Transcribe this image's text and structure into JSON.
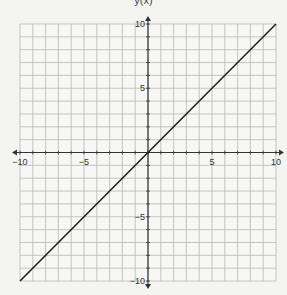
{
  "title": "y(x)",
  "chart_data": {
    "type": "line",
    "title": "y(x)",
    "xlabel": "",
    "ylabel": "",
    "xlim": [
      -10,
      10
    ],
    "ylim": [
      -10,
      10
    ],
    "grid": true,
    "grid_step": 1,
    "x_ticks": [
      -10,
      -5,
      5,
      10
    ],
    "y_ticks": [
      -10,
      -5,
      5,
      10
    ],
    "series": [
      {
        "name": "y = x",
        "x": [
          -10,
          10
        ],
        "y": [
          -10,
          10
        ],
        "color": "#222222"
      }
    ]
  },
  "colors": {
    "grid": "#b8b8b8",
    "axis": "#333333",
    "line": "#222222",
    "background": "#f4f4f2"
  }
}
